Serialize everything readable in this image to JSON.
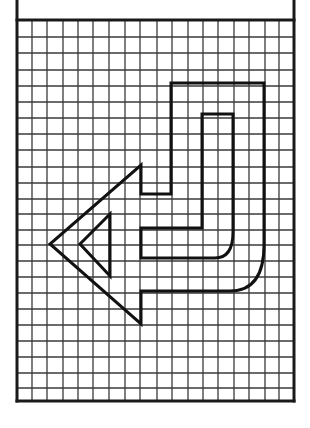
{
  "figure": {
    "type": "grid-drawing",
    "colors": {
      "background": "#ffffff",
      "grid_line": "#3a3a3a",
      "frame": "#1a1a1a",
      "shape_stroke": "#111111"
    },
    "frame": {
      "left": 17,
      "top": 0,
      "right": 294,
      "bottom": 401,
      "header_bottom": 20
    },
    "grid": {
      "columns": 18,
      "rows": 24,
      "x_lines": [
        17,
        32,
        47,
        63,
        78,
        93,
        109,
        125,
        140,
        157,
        172,
        188,
        203,
        218,
        234,
        249,
        265,
        279,
        294
      ],
      "y_lines": [
        20,
        37,
        53,
        70,
        86,
        102,
        118,
        134,
        150,
        167,
        183,
        199,
        214,
        230,
        245,
        261,
        277,
        293,
        309,
        325,
        341,
        357,
        373,
        388,
        401
      ]
    },
    "shape": {
      "outer_outline": "M141,165 L141,194 L171,194 L171,83 L264,83 L264,245 Q264,291 230,291 L141,291 L141,324 L50,244 Z",
      "inner_outline": "M141,228 L141,258 L215,258 Q233,258 233,232 L233,114 L202,114 L202,228 Z",
      "inner_triangle": "M110,214 L80,244 L110,276 Z"
    }
  }
}
